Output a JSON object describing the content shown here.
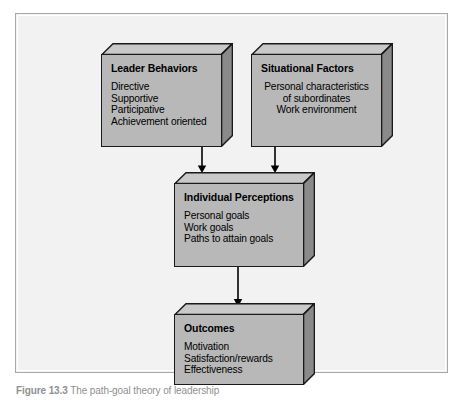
{
  "figure": {
    "caption_label": "Figure 13.3",
    "caption_text": "The path-goal theory of leadership",
    "frame_background": "#f2f2f2",
    "frame_border": "#a8a8a8"
  },
  "style": {
    "box_face_color": "#b8b8b8",
    "box_top_color": "#c9c9c9",
    "box_side_color": "#8a8a8a",
    "box_outline_color": "#1a1a1a",
    "connector_color": "#000000"
  },
  "boxes": {
    "leader_behaviors": {
      "title": "Leader Behaviors",
      "items": [
        "Directive",
        "Supportive",
        "Participative",
        "Achievement oriented"
      ]
    },
    "situational_factors": {
      "title": "Situational Factors",
      "items": [
        "Personal characteristics",
        "of subordinates",
        "Work environment"
      ]
    },
    "individual_perceptions": {
      "title": "Individual Perceptions",
      "items": [
        "Personal goals",
        "Work goals",
        "Paths to attain goals"
      ]
    },
    "outcomes": {
      "title": "Outcomes",
      "items": [
        "Motivation",
        "Satisfaction/rewards",
        "Effectiveness"
      ]
    }
  },
  "connectors": [
    {
      "name": "leader-behaviors-to-individual-perceptions",
      "from": "leader_behaviors",
      "to": "individual_perceptions",
      "direction": "down"
    },
    {
      "name": "situational-factors-to-individual-perceptions",
      "from": "situational_factors",
      "to": "individual_perceptions",
      "direction": "down"
    },
    {
      "name": "individual-perceptions-to-outcomes",
      "from": "individual_perceptions",
      "to": "outcomes",
      "direction": "down"
    }
  ]
}
